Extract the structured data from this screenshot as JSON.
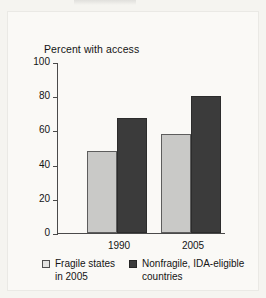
{
  "figure": {
    "background_color": "#f5f4f0",
    "plate_color": "#faf9f6"
  },
  "chart_data": {
    "type": "bar",
    "title": "",
    "subtitle": "",
    "xlabel": "",
    "ylabel": "Percent with access",
    "ylim": [
      0,
      100
    ],
    "ytick_values": [
      "100",
      "80",
      "60",
      "40",
      "20",
      "0"
    ],
    "grid": false,
    "legend_position": "bottom",
    "categories": [
      "1990",
      "2005"
    ],
    "series": [
      {
        "name": "Fragile states in 2005",
        "name_line1": "Fragile states",
        "name_line2": "in 2005",
        "color": "#c9c9c7",
        "values": [
          48,
          58
        ]
      },
      {
        "name": "Nonfragile, IDA-eligible countries",
        "name_line1": "Nonfragile, IDA-eligible",
        "name_line2": "countries",
        "color": "#3b3b3b",
        "values": [
          67,
          80
        ]
      }
    ]
  }
}
